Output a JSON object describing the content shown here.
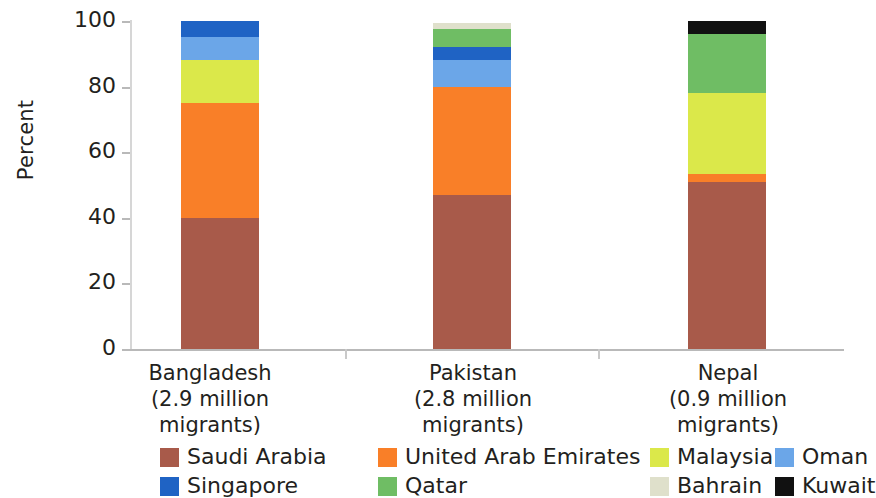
{
  "chart_data": {
    "type": "bar",
    "subtype": "stacked-percentage",
    "title": "",
    "xlabel": "",
    "ylabel": "Percent",
    "ylim": [
      0,
      100
    ],
    "yticks": [
      0,
      20,
      40,
      60,
      80,
      100
    ],
    "grid": false,
    "legend_position": "bottom",
    "categories": [
      "Bangladesh",
      "Pakistan",
      "Nepal"
    ],
    "category_sublabels": [
      "(2.9 million migrants)",
      "(2.8 million migrants)",
      "(0.9 million migrants)"
    ],
    "series": [
      {
        "name": "Saudi Arabia",
        "color": "#a85a4a",
        "values": [
          40,
          47,
          51
        ]
      },
      {
        "name": "United Arab Emirates",
        "color": "#f97f28",
        "values": [
          35,
          33,
          2.5
        ]
      },
      {
        "name": "Malaysia",
        "color": "#dbe84a",
        "values": [
          13,
          0,
          24.5
        ]
      },
      {
        "name": "Oman",
        "color": "#6ba6e8",
        "values": [
          7,
          8,
          0
        ]
      },
      {
        "name": "Singapore",
        "color": "#1f63c4",
        "values": [
          5,
          4,
          0
        ]
      },
      {
        "name": "Qatar",
        "color": "#6fbd64",
        "values": [
          0,
          5.5,
          18
        ]
      },
      {
        "name": "Bahrain",
        "color": "#dfe0cb",
        "values": [
          0,
          2,
          0
        ]
      },
      {
        "name": "Kuwait",
        "color": "#111111",
        "values": [
          0,
          0,
          4
        ]
      }
    ]
  },
  "axis": {
    "y_title": "Percent",
    "y_ticks": [
      "0",
      "20",
      "40",
      "60",
      "80",
      "100"
    ]
  },
  "legend": {
    "row1": [
      {
        "label": "Saudi Arabia",
        "color": "#a85a4a"
      },
      {
        "label": "United Arab Emirates",
        "color": "#f97f28"
      },
      {
        "label": "Malaysia",
        "color": "#dbe84a"
      },
      {
        "label": "Oman",
        "color": "#6ba6e8"
      }
    ],
    "row2": [
      {
        "label": "Singapore",
        "color": "#1f63c4"
      },
      {
        "label": "Qatar",
        "color": "#6fbd64"
      },
      {
        "label": "Bahrain",
        "color": "#dfe0cb"
      },
      {
        "label": "Kuwait",
        "color": "#111111"
      }
    ]
  },
  "categories": [
    {
      "name": "Bangladesh",
      "sublabel": "(2.9 million migrants)"
    },
    {
      "name": "Pakistan",
      "sublabel": "(2.8 million migrants)"
    },
    {
      "name": "Nepal",
      "sublabel": "(0.9 million migrants)"
    }
  ]
}
